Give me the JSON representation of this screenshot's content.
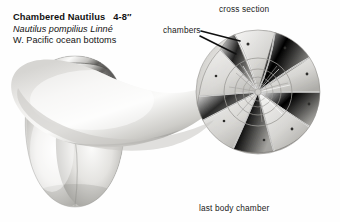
{
  "figure": {
    "title_block": {
      "common_name": "Chambered Nautilus",
      "size": "4-8″",
      "scientific_name": "Nautilus pompilius Linné",
      "habitat": "W. Pacific ocean bottoms"
    },
    "labels": {
      "cross_section": "cross section",
      "chambers": "chambers",
      "last_body_chamber": "last body chamber"
    },
    "colors": {
      "background": "#fefefe",
      "text": "#111111",
      "leader_line": "#101010",
      "shell_light": "#f2f2f0",
      "shell_mid": "#b9b9b6",
      "shell_dark": "#6e6e6b",
      "aperture_dark": "#141414"
    },
    "views": {
      "left": {
        "name": "aperture-view-shell",
        "description": "front view of whole shell showing dark hood and aperture"
      },
      "right": {
        "name": "cross-section-shell",
        "description": "sagittal cut showing logarithmic spiral of gas chambers"
      }
    }
  }
}
